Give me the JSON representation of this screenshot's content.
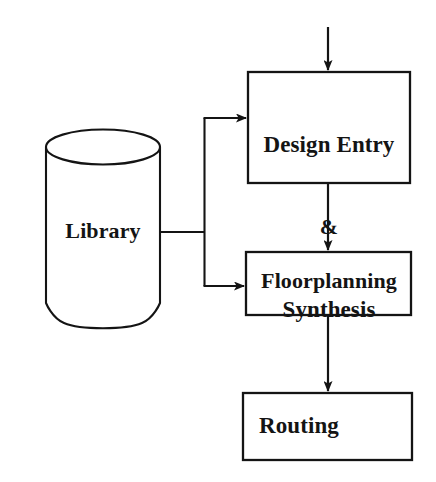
{
  "diagram": {
    "background_color": "#ffffff",
    "stroke_color": "#141414",
    "text_color": "#141414",
    "nodes": [
      {
        "id": "library",
        "shape": "cylinder",
        "label": "Library"
      },
      {
        "id": "design_entry_synthesis",
        "shape": "rectangle",
        "label_lines": {
          "line1": "Design Entry",
          "line2": "&",
          "line3": "Synthesis"
        }
      },
      {
        "id": "floorplanning",
        "shape": "rectangle",
        "label": "Floorplanning"
      },
      {
        "id": "routing",
        "shape": "rectangle",
        "label": "Routing"
      }
    ],
    "edges": [
      {
        "id": "input-to-design-entry",
        "from": "",
        "to": "design_entry_synthesis",
        "arrow": true
      },
      {
        "id": "library-to-design-entry",
        "from": "library",
        "to": "design_entry_synthesis",
        "arrow": true
      },
      {
        "id": "library-to-floorplanning",
        "from": "library",
        "to": "floorplanning",
        "arrow": true
      },
      {
        "id": "design-entry-to-floorplanning",
        "from": "design_entry_synthesis",
        "to": "floorplanning",
        "arrow": true
      },
      {
        "id": "floorplanning-to-routing",
        "from": "floorplanning",
        "to": "routing",
        "arrow": true
      }
    ]
  }
}
